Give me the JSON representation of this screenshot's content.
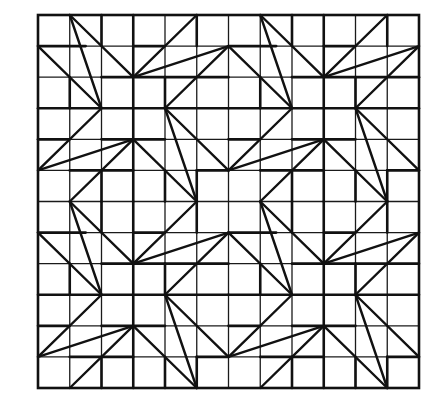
{
  "figure": {
    "grid": {
      "cols": 12,
      "rows": 12,
      "left": 38,
      "top": 15,
      "right": 419,
      "bottom": 388
    },
    "colors": {
      "line": "#111111",
      "background": "#ffffff"
    },
    "block_size": 6,
    "block_origins": [
      [
        0,
        0
      ],
      [
        6,
        0
      ],
      [
        0,
        6
      ],
      [
        6,
        6
      ]
    ],
    "motif_diagonals": [
      [
        [
          1,
          0
        ],
        [
          3,
          2
        ]
      ],
      [
        [
          1,
          0
        ],
        [
          2,
          3
        ]
      ],
      [
        [
          0,
          1
        ],
        [
          2,
          3
        ]
      ],
      [
        [
          5,
          0
        ],
        [
          3,
          2
        ]
      ],
      [
        [
          6,
          1
        ],
        [
          3,
          2
        ]
      ],
      [
        [
          6,
          1
        ],
        [
          4,
          3
        ]
      ],
      [
        [
          4,
          3
        ],
        [
          5,
          6
        ]
      ],
      [
        [
          4,
          3
        ],
        [
          6,
          5
        ]
      ],
      [
        [
          2,
          3
        ],
        [
          0,
          5
        ]
      ],
      [
        [
          3,
          4
        ],
        [
          0,
          5
        ]
      ],
      [
        [
          3,
          4
        ],
        [
          1,
          6
        ]
      ],
      [
        [
          3,
          4
        ],
        [
          5,
          6
        ]
      ]
    ],
    "bold_segments": [
      [
        [
          0,
          3
        ],
        [
          6,
          3
        ]
      ],
      [
        [
          3,
          0
        ],
        [
          3,
          6
        ]
      ],
      [
        [
          0,
          1
        ],
        [
          1.5,
          1
        ]
      ],
      [
        [
          3,
          1
        ],
        [
          4,
          1
        ]
      ],
      [
        [
          2,
          2
        ],
        [
          6,
          2
        ]
      ],
      [
        [
          2,
          0
        ],
        [
          2,
          1
        ]
      ],
      [
        [
          5,
          0
        ],
        [
          5,
          1
        ]
      ],
      [
        [
          4,
          2
        ],
        [
          4,
          3
        ]
      ],
      [
        [
          0,
          4
        ],
        [
          1,
          4
        ]
      ],
      [
        [
          2,
          4
        ],
        [
          4,
          4
        ]
      ],
      [
        [
          1,
          5
        ],
        [
          3,
          5
        ]
      ],
      [
        [
          5,
          5
        ],
        [
          6,
          5
        ]
      ],
      [
        [
          2,
          5
        ],
        [
          2,
          6
        ]
      ],
      [
        [
          5,
          5
        ],
        [
          5,
          6
        ]
      ],
      [
        [
          4,
          5
        ],
        [
          4,
          6
        ]
      ],
      [
        [
          1,
          2
        ],
        [
          1,
          3
        ]
      ]
    ]
  }
}
